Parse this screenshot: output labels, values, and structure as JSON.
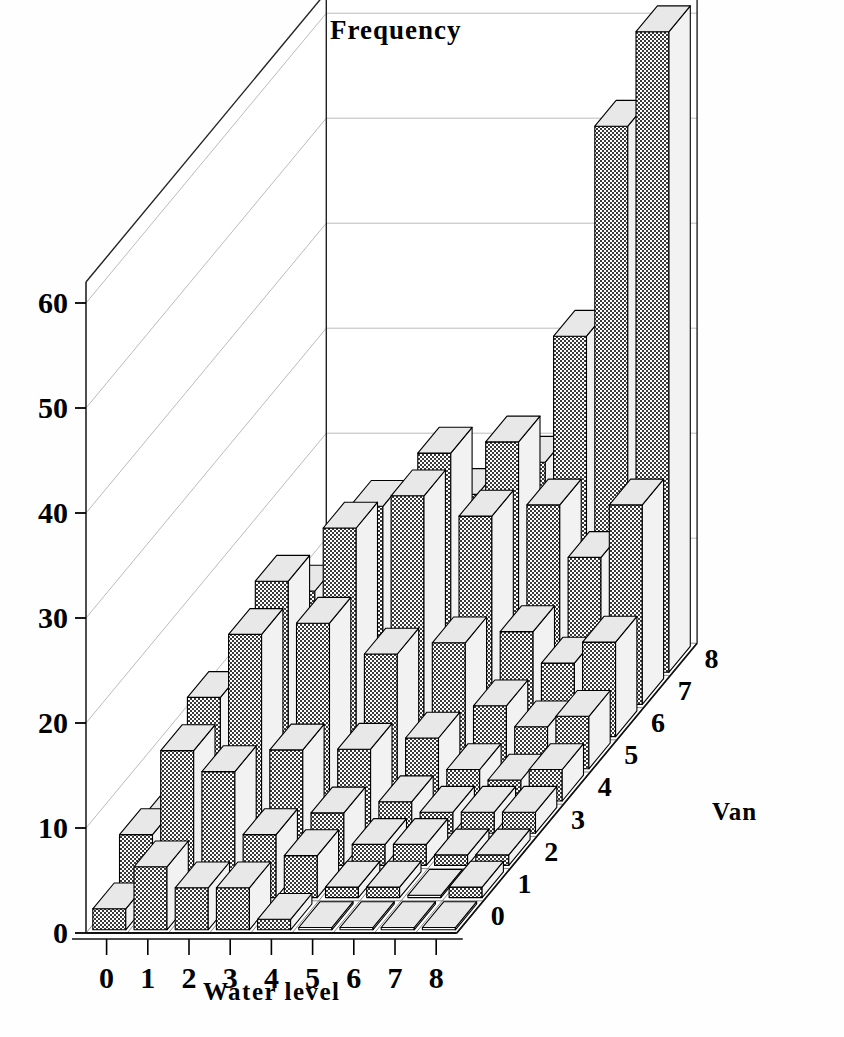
{
  "chart_data": {
    "type": "bar",
    "subtype": "3d-bar-histogram",
    "title": "Frequency",
    "xlabel": "Water level",
    "zlabel": "Van",
    "ylabel": "Frequency",
    "x_categories": [
      "0",
      "1",
      "2",
      "3",
      "4",
      "5",
      "6",
      "7",
      "8"
    ],
    "z_categories": [
      "0",
      "1",
      "2",
      "3",
      "4",
      "5",
      "6",
      "7",
      "8"
    ],
    "y_ticks": [
      "0",
      "10",
      "20",
      "30",
      "40",
      "50",
      "60"
    ],
    "ylim": [
      0,
      62
    ],
    "grid": true,
    "legend": "none",
    "series_note": "values[z][x] = frequency count for Van level z and Water level x",
    "values": [
      [
        2,
        6,
        4,
        4,
        1,
        0,
        0,
        0,
        0
      ],
      [
        6,
        14,
        12,
        6,
        4,
        1,
        1,
        0,
        1
      ],
      [
        5,
        16,
        22,
        11,
        5,
        2,
        2,
        1,
        1
      ],
      [
        3,
        13,
        24,
        20,
        8,
        3,
        2,
        2,
        2
      ],
      [
        2,
        10,
        20,
        26,
        14,
        6,
        3,
        2,
        3
      ],
      [
        1,
        6,
        15,
        25,
        26,
        12,
        6,
        4,
        5
      ],
      [
        1,
        3,
        9,
        18,
        27,
        21,
        10,
        7,
        9
      ],
      [
        1,
        2,
        5,
        11,
        20,
        25,
        19,
        14,
        19
      ],
      [
        0,
        1,
        3,
        6,
        12,
        20,
        32,
        52,
        61
      ]
    ],
    "colors": {
      "bar_front": "#555555",
      "bar_top": "#e8e8e8",
      "bar_side": "#f2f2f2",
      "outline": "#000000",
      "grid": "#bbbbbb",
      "axis": "#000000",
      "background": "#ffffff"
    }
  },
  "axes": {
    "title_label": "Frequency",
    "x_axis_label": "Water level",
    "z_axis_label": "Van",
    "y_tick_labels": [
      "0",
      "10",
      "20",
      "30",
      "40",
      "50",
      "60"
    ],
    "x_tick_labels": [
      "0",
      "1",
      "2",
      "3",
      "4",
      "5",
      "6",
      "7",
      "8"
    ],
    "z_tick_labels": [
      "0",
      "1",
      "2",
      "3",
      "4",
      "5",
      "6",
      "7",
      "8"
    ]
  }
}
